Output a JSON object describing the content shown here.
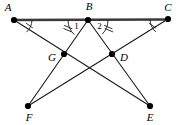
{
  "figure": {
    "width": 178,
    "height": 125,
    "background_color": "#ffffff",
    "line_color": "#1a1a1a",
    "baseline_color": "#3a3a3a"
  },
  "points": [
    {
      "id": "A",
      "label": "A",
      "x": 14,
      "y": 20,
      "label_x": 8,
      "label_y": 8
    },
    {
      "id": "B",
      "label": "B",
      "x": 88,
      "y": 20,
      "label_x": 89,
      "label_y": 7
    },
    {
      "id": "C",
      "label": "C",
      "x": 168,
      "y": 19,
      "label_x": 168,
      "label_y": 8
    },
    {
      "id": "G",
      "label": "G",
      "x": 64,
      "y": 54,
      "label_x": 52,
      "label_y": 58
    },
    {
      "id": "D",
      "label": "D",
      "x": 112,
      "y": 54,
      "label_x": 124,
      "label_y": 58
    },
    {
      "id": "F",
      "label": "F",
      "x": 28,
      "y": 106,
      "label_x": 29,
      "label_y": 118
    },
    {
      "id": "E",
      "label": "E",
      "x": 150,
      "y": 106,
      "label_x": 150,
      "label_y": 118
    }
  ],
  "segments": [
    {
      "name": "segment-AC",
      "from": "A",
      "to": "C",
      "style": "thick"
    },
    {
      "name": "segment-AE",
      "from": "A",
      "to": "E",
      "style": "thin"
    },
    {
      "name": "segment-CF",
      "from": "C",
      "to": "F",
      "style": "thin"
    },
    {
      "name": "segment-BF",
      "from": "B",
      "to": "F",
      "style": "thin"
    },
    {
      "name": "segment-BE",
      "from": "B",
      "to": "E",
      "style": "thin"
    }
  ],
  "angle_marks": [
    {
      "name": "angle-A-mark",
      "vertex": "A",
      "ticks": 1,
      "label": ""
    },
    {
      "name": "angle-1-mark",
      "vertex": "B",
      "ticks": 2,
      "label": "1"
    },
    {
      "name": "angle-2-mark",
      "vertex": "B",
      "ticks": 2,
      "label": "2"
    },
    {
      "name": "angle-C-mark",
      "vertex": "C",
      "ticks": 1,
      "label": ""
    }
  ],
  "angle_labels": {
    "angle_one": "1",
    "angle_two": "2"
  }
}
